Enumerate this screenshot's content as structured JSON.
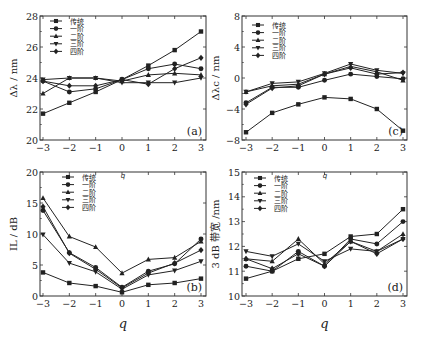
{
  "figure": {
    "legend": [
      "传统",
      "一阶",
      "二阶",
      "三阶",
      "四阶"
    ],
    "markers": [
      "square",
      "circle",
      "triangle-up",
      "triangle-down",
      "diamond"
    ],
    "line_color": "#222222",
    "x_label": "q"
  },
  "chart_data": [
    {
      "id": "a",
      "type": "line",
      "panel_label": "(a)",
      "ylabel": "Δλ / nm",
      "xlabel": "",
      "x": [
        -3,
        -2,
        -1,
        0,
        1,
        2,
        3
      ],
      "xticks": [
        -3,
        -2,
        -1,
        0,
        1,
        2,
        3
      ],
      "ylim": [
        20,
        28
      ],
      "yticks": [
        20,
        22,
        24,
        26,
        28
      ],
      "grid": false,
      "legend_position": "upper left",
      "series": [
        {
          "name": "传统",
          "values": [
            21.7,
            22.4,
            23.1,
            23.9,
            24.8,
            25.8,
            27.0
          ]
        },
        {
          "name": "一阶",
          "values": [
            23.8,
            23.1,
            23.3,
            23.9,
            24.6,
            24.9,
            24.6
          ]
        },
        {
          "name": "二阶",
          "values": [
            23.0,
            24.0,
            24.0,
            23.8,
            24.2,
            24.3,
            24.2
          ]
        },
        {
          "name": "三阶",
          "values": [
            23.9,
            24.0,
            24.0,
            23.7,
            23.7,
            23.7,
            24.0
          ]
        },
        {
          "name": "四阶",
          "values": [
            23.8,
            23.5,
            23.5,
            23.9,
            23.6,
            24.6,
            25.3
          ]
        }
      ]
    },
    {
      "id": "c",
      "type": "line",
      "panel_label": "(c)",
      "ylabel": "Δλc / nm",
      "xlabel": "",
      "x": [
        -3,
        -2,
        -1,
        0,
        1,
        2,
        3
      ],
      "xticks": [
        -3,
        -2,
        -1,
        0,
        1,
        2,
        3
      ],
      "ylim": [
        -8,
        8
      ],
      "yticks": [
        -8,
        -4,
        0,
        4,
        8
      ],
      "grid": false,
      "legend_position": "upper left",
      "series": [
        {
          "name": "传统",
          "values": [
            -7.0,
            -4.5,
            -3.4,
            -2.5,
            -2.7,
            -4.0,
            -6.8
          ]
        },
        {
          "name": "一阶",
          "values": [
            -3.2,
            -1.2,
            -1.2,
            -0.3,
            0.5,
            0.2,
            -0.1
          ]
        },
        {
          "name": "二阶",
          "values": [
            -1.8,
            -1.0,
            -0.8,
            0.5,
            1.5,
            0.8,
            -0.3
          ]
        },
        {
          "name": "三阶",
          "values": [
            -1.8,
            -0.7,
            -0.5,
            0.6,
            1.8,
            1.0,
            0.6
          ]
        },
        {
          "name": "四阶",
          "values": [
            -3.4,
            -1.3,
            -1.0,
            0.5,
            1.3,
            0.5,
            0.7
          ]
        }
      ]
    },
    {
      "id": "b",
      "type": "line",
      "panel_label": "(b)",
      "ylabel": "IL / dB",
      "xlabel": "q",
      "x": [
        -3,
        -2,
        -1,
        0,
        1,
        2,
        3
      ],
      "xticks": [
        -3,
        -2,
        -1,
        0,
        1,
        2,
        3
      ],
      "ylim": [
        0,
        20
      ],
      "yticks": [
        0,
        5,
        10,
        15,
        20
      ],
      "grid": false,
      "legend_position": "upper left",
      "series": [
        {
          "name": "传统",
          "values": [
            3.8,
            2.1,
            1.6,
            0.6,
            1.8,
            2.1,
            2.8
          ]
        },
        {
          "name": "一阶",
          "values": [
            13.8,
            7.0,
            4.6,
            1.4,
            4.0,
            5.2,
            9.2
          ]
        },
        {
          "name": "二阶",
          "values": [
            15.8,
            9.6,
            7.9,
            3.7,
            5.9,
            6.2,
            8.8
          ]
        },
        {
          "name": "三阶",
          "values": [
            9.9,
            5.3,
            3.9,
            1.1,
            3.4,
            4.1,
            5.6
          ]
        },
        {
          "name": "四阶",
          "values": [
            14.4,
            6.9,
            4.3,
            1.3,
            3.7,
            5.3,
            7.4
          ]
        }
      ]
    },
    {
      "id": "d",
      "type": "line",
      "panel_label": "(d)",
      "ylabel": "3 dB 带宽 /nm",
      "xlabel": "q",
      "x": [
        -3,
        -2,
        -1,
        0,
        1,
        2,
        3
      ],
      "xticks": [
        -3,
        -2,
        -1,
        0,
        1,
        2,
        3
      ],
      "ylim": [
        10,
        15
      ],
      "yticks": [
        10,
        11,
        12,
        13,
        14,
        15
      ],
      "grid": false,
      "legend_position": "upper left",
      "series": [
        {
          "name": "传统",
          "values": [
            10.7,
            11.0,
            11.5,
            11.7,
            12.4,
            12.5,
            13.5
          ]
        },
        {
          "name": "一阶",
          "values": [
            11.2,
            11.0,
            11.8,
            11.2,
            12.3,
            12.1,
            13.0
          ]
        },
        {
          "name": "二阶",
          "values": [
            11.5,
            11.4,
            12.3,
            11.3,
            12.2,
            11.8,
            12.5
          ]
        },
        {
          "name": "三阶",
          "values": [
            11.8,
            11.6,
            12.1,
            11.4,
            11.9,
            11.8,
            12.3
          ]
        },
        {
          "name": "四阶",
          "values": [
            11.5,
            11.1,
            11.7,
            11.2,
            12.2,
            11.7,
            12.3
          ]
        }
      ]
    }
  ],
  "panels": {
    "a": {
      "label": "(a)",
      "ylabel": "Δλ / nm",
      "xlabel": ""
    },
    "c": {
      "label": "(c)",
      "ylabel": "Δλc / nm",
      "xlabel": ""
    },
    "b": {
      "label": "(b)",
      "ylabel": "IL / dB",
      "xlabel": "q"
    },
    "d": {
      "label": "(d)",
      "ylabel": "3 dB 带宽 /nm",
      "xlabel": "q"
    }
  }
}
